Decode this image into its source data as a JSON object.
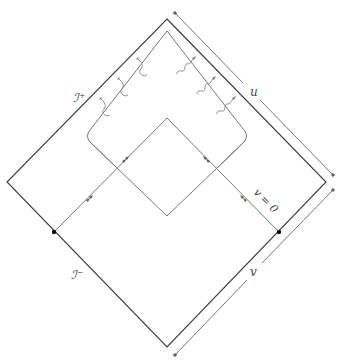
{
  "diagram": {
    "type": "penrose-diagram",
    "labels": {
      "scri_plus": "ℐ⁺",
      "scri_minus": "ℐ⁻",
      "u_axis": "u",
      "v_axis": "v",
      "v_zero": "v = 0"
    },
    "colors": {
      "outer_line": "#3a3a3a",
      "inner_line": "#777777",
      "wave": "#888888",
      "arrow_axis": "#666666",
      "dot": "#111111"
    }
  }
}
